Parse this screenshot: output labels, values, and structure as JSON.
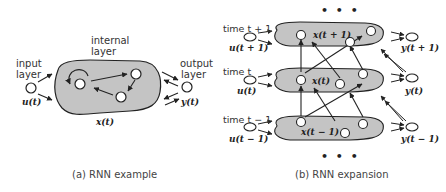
{
  "panel_a": {
    "caption": "(a) RNN example",
    "input_layer_label_1": "input",
    "input_layer_label_2": "layer",
    "internal_layer_label_1": "internal",
    "internal_layer_label_2": "layer",
    "output_layer_label_1": "output",
    "output_layer_label_2": "layer",
    "input_symbol": "u(t)",
    "state_symbol": "x(t)",
    "output_symbol": "y(t)"
  },
  "panel_b": {
    "caption": "(b) RNN  expansion",
    "ellipsis_top": "• • •",
    "ellipsis_bottom": "• • •",
    "rows": [
      {
        "time_label": "time t + 1",
        "input": "u(t + 1)",
        "state": "x(t + 1)",
        "output": "y(t + 1)"
      },
      {
        "time_label": "time t",
        "input": "u(t)",
        "state": "x(t)",
        "output": "y(t)"
      },
      {
        "time_label": "time t − 1",
        "input": "u(t − 1)",
        "state": "x(t − 1)",
        "output": "y(t − 1)"
      }
    ]
  },
  "colors": {
    "blob_fill": "#c4c4c4",
    "stroke": "#222222",
    "node_fill": "#ffffff"
  }
}
